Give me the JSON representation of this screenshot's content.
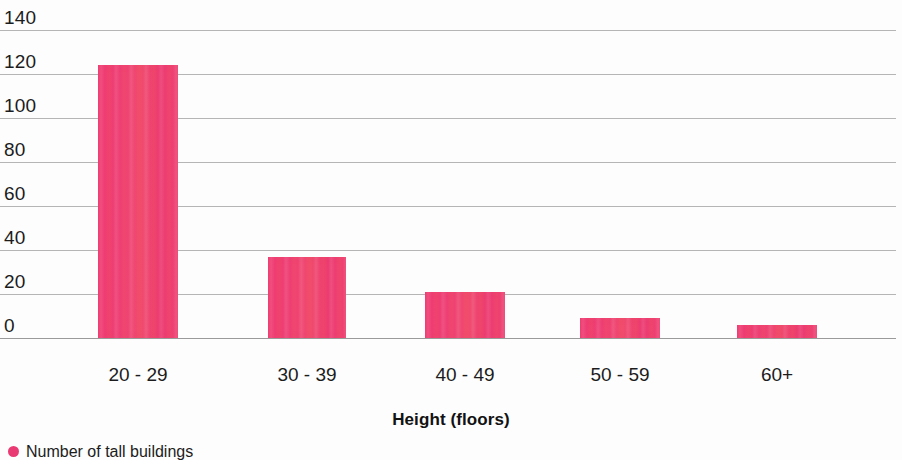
{
  "chart_data": {
    "type": "bar",
    "title": "",
    "subtitle": "",
    "categories": [
      "20 - 29",
      "30 - 39",
      "40 - 49",
      "50 - 59",
      "60+"
    ],
    "values": [
      124,
      37,
      21,
      9,
      6
    ],
    "series": [
      {
        "name": "Number of tall buildings",
        "values": [
          124,
          37,
          21,
          9,
          6
        ],
        "color": "#ea3a74"
      }
    ],
    "xlabel": "Height (floors)",
    "ylabel": "",
    "ylim": [
      0,
      140
    ],
    "ytick_values": [
      140,
      120,
      100,
      80,
      60,
      40,
      20,
      0
    ],
    "ytick_labels": [
      "140",
      "120",
      "100",
      "80",
      "60",
      "40",
      "20",
      "0"
    ],
    "grid": true,
    "grid_axis": "y",
    "legend_position": "bottom-left",
    "legend_entries": [
      "Number of tall buildings"
    ],
    "bar_color": "#ea3a74",
    "gridline_color": "#b5b5b5",
    "background_color": "#fdfdfd"
  },
  "axis": {
    "x_title": "Height (floors)",
    "y_ticks": [
      "140",
      "120",
      "100",
      "80",
      "60",
      "40",
      "20",
      "0"
    ],
    "x_ticks": [
      "20 - 29",
      "30 - 39",
      "40 - 49",
      "50 - 59",
      "60+"
    ]
  },
  "legend": {
    "marker_icon": "circle-marker-icon",
    "label": "Number of tall buildings"
  }
}
